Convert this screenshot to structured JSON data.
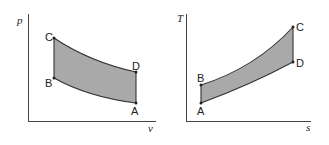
{
  "diagrams": [
    {
      "name": "pv-diagram",
      "y_axis_label": "p",
      "x_axis_label": "v",
      "points": {
        "A": "A",
        "B": "B",
        "C": "C",
        "D": "D"
      }
    },
    {
      "name": "Ts-diagram",
      "y_axis_label": "T",
      "x_axis_label": "s",
      "points": {
        "A": "A",
        "B": "B",
        "C": "C",
        "D": "D"
      }
    }
  ],
  "colors": {
    "fill": "#a9a9a9",
    "line": "#333333",
    "axis": "#444444"
  }
}
